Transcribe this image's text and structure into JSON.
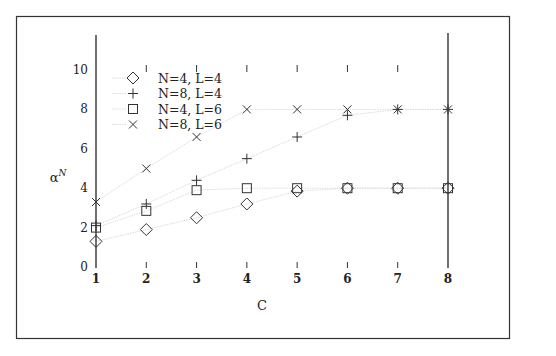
{
  "chart_data": {
    "type": "scatter",
    "title": "",
    "xlabel": "C",
    "ylabel": "α^N",
    "ylabel_base": "α",
    "ylabel_sup": "N",
    "xlim": [
      1,
      8
    ],
    "ylim": [
      0,
      11
    ],
    "x": [
      1,
      2,
      3,
      4,
      5,
      6,
      7,
      8
    ],
    "x_tick_labels": [
      "1",
      "2",
      "3",
      "4",
      "5",
      "6",
      "7",
      "8"
    ],
    "y_ticks": [
      0,
      2,
      4,
      6,
      8,
      10
    ],
    "y_tick_labels": [
      "0",
      "2",
      "4",
      "6",
      "8",
      "10"
    ],
    "grid": false,
    "legend_position": "upper left",
    "series": [
      {
        "name": "N=4, L=4",
        "marker": "diamond",
        "values": [
          1.3,
          1.9,
          2.5,
          3.2,
          3.85,
          4.0,
          4.0,
          4.0
        ]
      },
      {
        "name": "N=8, L=4",
        "marker": "plus",
        "values": [
          2.1,
          3.2,
          4.4,
          5.5,
          6.6,
          7.7,
          8.0,
          8.0
        ]
      },
      {
        "name": "N=4, L=6",
        "marker": "square",
        "values": [
          2.0,
          2.85,
          3.9,
          4.0,
          4.0,
          4.0,
          4.0,
          4.0
        ]
      },
      {
        "name": "N=8, L=6",
        "marker": "cross",
        "values": [
          3.3,
          5.0,
          6.6,
          8.0,
          8.0,
          8.0,
          8.0,
          8.0
        ]
      }
    ]
  }
}
